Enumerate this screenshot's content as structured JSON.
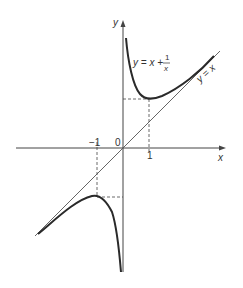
{
  "figure": {
    "axis_x_label": "x",
    "axis_y_label": "y",
    "origin_label": "0",
    "tick_neg1": "−1",
    "tick_pos1": "1",
    "curve_label_lhs": "y = x +",
    "curve_label_frac_num": "1",
    "curve_label_frac_den": "x",
    "asymptote_label": "y = x",
    "colors": {
      "curve": "#2a2a2a",
      "line": "#555555",
      "axes": "#444444"
    }
  }
}
